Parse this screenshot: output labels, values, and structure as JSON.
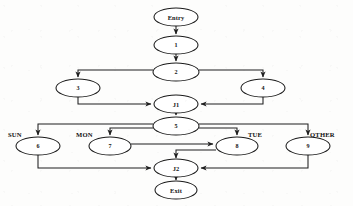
{
  "diagram": {
    "type": "flowchart",
    "background_color": "#fdfdfc",
    "line_color": "#1f1f1f",
    "node_fill": "#ffffff",
    "node_stroke": "#1a1a1a",
    "text_color": "#141414"
  },
  "nodes": [
    {
      "id": "entry",
      "label": "Entry",
      "shape": "ellipse",
      "cx": 176,
      "cy": 17,
      "rx": 22,
      "ry": 9
    },
    {
      "id": "n1",
      "label": "1",
      "shape": "ellipse",
      "cx": 176,
      "cy": 45,
      "rx": 22,
      "ry": 9
    },
    {
      "id": "n2",
      "label": "2",
      "shape": "ellipse",
      "cx": 176,
      "cy": 72,
      "rx": 23,
      "ry": 9
    },
    {
      "id": "n3",
      "label": "3",
      "shape": "ellipse",
      "cx": 78,
      "cy": 88,
      "rx": 22,
      "ry": 9
    },
    {
      "id": "n4",
      "label": "4",
      "shape": "ellipse",
      "cx": 263,
      "cy": 88,
      "rx": 22,
      "ry": 9
    },
    {
      "id": "j1",
      "label": "J1",
      "shape": "ellipse",
      "cx": 176,
      "cy": 104,
      "rx": 22,
      "ry": 9
    },
    {
      "id": "n5",
      "label": "5",
      "shape": "ellipse",
      "cx": 176,
      "cy": 126,
      "rx": 23,
      "ry": 9
    },
    {
      "id": "n6",
      "label": "6",
      "shape": "ellipse",
      "cx": 38,
      "cy": 146,
      "rx": 22,
      "ry": 9
    },
    {
      "id": "n7",
      "label": "7",
      "shape": "ellipse",
      "cx": 110,
      "cy": 146,
      "rx": 21,
      "ry": 9
    },
    {
      "id": "n8",
      "label": "8",
      "shape": "ellipse",
      "cx": 237,
      "cy": 146,
      "rx": 21,
      "ry": 9
    },
    {
      "id": "n9",
      "label": "9",
      "shape": "ellipse",
      "cx": 308,
      "cy": 146,
      "rx": 22,
      "ry": 9
    },
    {
      "id": "j2",
      "label": "J2",
      "shape": "ellipse",
      "cx": 176,
      "cy": 168,
      "rx": 22,
      "ry": 9
    },
    {
      "id": "exit",
      "label": "Exit",
      "shape": "ellipse",
      "cx": 176,
      "cy": 190,
      "rx": 21,
      "ry": 9
    }
  ],
  "edge_labels": [
    {
      "id": "sun",
      "text": "SUN",
      "x": 8,
      "y": 134
    },
    {
      "id": "mon",
      "text": "MON",
      "x": 76,
      "y": 134
    },
    {
      "id": "tue",
      "text": "TUE",
      "x": 248,
      "y": 134
    },
    {
      "id": "other",
      "text": "OTHER",
      "x": 310,
      "y": 134
    }
  ],
  "edges": [
    {
      "id": "entry-1",
      "from": "entry",
      "to": "n1"
    },
    {
      "id": "1-2",
      "from": "n1",
      "to": "n2"
    },
    {
      "id": "2-3",
      "from": "n2",
      "to": "n3"
    },
    {
      "id": "2-4",
      "from": "n2",
      "to": "n4"
    },
    {
      "id": "3-j1",
      "from": "n3",
      "to": "j1"
    },
    {
      "id": "4-j1",
      "from": "n4",
      "to": "j1"
    },
    {
      "id": "j1-5",
      "from": "j1",
      "to": "n5"
    },
    {
      "id": "5-6",
      "from": "n5",
      "to": "n6",
      "label": "SUN"
    },
    {
      "id": "5-7",
      "from": "n5",
      "to": "n7",
      "label": "MON"
    },
    {
      "id": "5-8",
      "from": "n5",
      "to": "n8",
      "label": "TUE"
    },
    {
      "id": "5-9",
      "from": "n5",
      "to": "n9",
      "label": "OTHER"
    },
    {
      "id": "6-j2",
      "from": "n6",
      "to": "j2"
    },
    {
      "id": "7-8",
      "from": "n7",
      "to": "n8"
    },
    {
      "id": "8-j2",
      "from": "n8",
      "to": "j2"
    },
    {
      "id": "9-j2",
      "from": "n9",
      "to": "j2"
    },
    {
      "id": "j2-exit",
      "from": "j2",
      "to": "exit"
    }
  ]
}
